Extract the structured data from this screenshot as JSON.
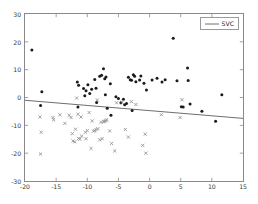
{
  "chart_data": {
    "type": "scatter",
    "title": "",
    "xlabel": "",
    "ylabel": "",
    "xlim": [
      -20,
      15
    ],
    "ylim": [
      -30,
      30
    ],
    "xticks": [
      -20,
      -15,
      -10,
      -5,
      0,
      5,
      10,
      15
    ],
    "yticks": [
      -30,
      -20,
      -10,
      0,
      10,
      20,
      30
    ],
    "xtick_labels": [
      "-20",
      "-15",
      "-10",
      "-5",
      "0",
      "5",
      "10",
      "15"
    ],
    "ytick_labels": [
      "-30",
      "-20",
      "-10",
      "0",
      "10",
      "20",
      "30"
    ],
    "grid": false,
    "legend_position": "upper right",
    "series": [
      {
        "name": "class-1",
        "marker": "o",
        "color": "#1a1a1a",
        "size": 3.0,
        "points": [
          [
            -18.9,
            17.1
          ],
          [
            -17.3,
            2.1
          ],
          [
            -17.5,
            -2.9
          ],
          [
            -11.6,
            5.6
          ],
          [
            -11.4,
            4.4
          ],
          [
            -11.5,
            -3.4
          ],
          [
            -10.6,
            3.2
          ],
          [
            -10.2,
            2.4
          ],
          [
            -10.4,
            0.6
          ],
          [
            -9.9,
            4.6
          ],
          [
            -9.6,
            1.4
          ],
          [
            -9.3,
            3.0
          ],
          [
            -8.8,
            6.5
          ],
          [
            -8.6,
            3.3
          ],
          [
            -8.5,
            -1.8
          ],
          [
            -8.0,
            7.6
          ],
          [
            -7.7,
            8.0
          ],
          [
            -7.4,
            10.3
          ],
          [
            -7.2,
            6.7
          ],
          [
            -7.0,
            7.4
          ],
          [
            -7.1,
            1.0
          ],
          [
            -6.8,
            -3.9
          ],
          [
            -6.3,
            4.9
          ],
          [
            -6.2,
            -6.4
          ],
          [
            -5.4,
            0.3
          ],
          [
            -5.0,
            -0.4
          ],
          [
            -4.6,
            -1.9
          ],
          [
            -4.2,
            -0.6
          ],
          [
            -4.0,
            -2.6
          ],
          [
            -3.7,
            -2.2
          ],
          [
            -3.4,
            7.3
          ],
          [
            -3.1,
            6.4
          ],
          [
            -2.9,
            6.2
          ],
          [
            -2.6,
            8.2
          ],
          [
            -2.4,
            7.6
          ],
          [
            -2.8,
            -4.7
          ],
          [
            -2.2,
            5.7
          ],
          [
            -1.6,
            6.3
          ],
          [
            -1.4,
            7.7
          ],
          [
            -0.9,
            5.1
          ],
          [
            -0.5,
            2.7
          ],
          [
            0.4,
            6.3
          ],
          [
            1.2,
            6.9
          ],
          [
            2.0,
            5.6
          ],
          [
            2.5,
            6.4
          ],
          [
            3.8,
            21.3
          ],
          [
            4.4,
            6.0
          ],
          [
            5.1,
            -3.3
          ],
          [
            5.4,
            -3.4
          ],
          [
            6.1,
            10.6
          ],
          [
            6.2,
            6.1
          ],
          [
            6.5,
            -2.3
          ],
          [
            8.4,
            -4.9
          ],
          [
            10.6,
            -8.5
          ],
          [
            11.6,
            1.0
          ]
        ]
      },
      {
        "name": "class-2",
        "marker": "x",
        "color": "#909090",
        "size": 3.0,
        "points": [
          [
            -17.6,
            -7.0
          ],
          [
            -17.4,
            -12.5
          ],
          [
            -17.5,
            -20.3
          ],
          [
            -15.5,
            -7.2
          ],
          [
            -15.4,
            -8.0
          ],
          [
            -14.4,
            -6.2
          ],
          [
            -13.6,
            -9.3
          ],
          [
            -12.9,
            -6.4
          ],
          [
            -12.6,
            -7.2
          ],
          [
            -12.4,
            -13.0
          ],
          [
            -12.3,
            -15.6
          ],
          [
            -12.0,
            -15.9
          ],
          [
            -11.9,
            -11.4
          ],
          [
            -11.7,
            -0.2
          ],
          [
            -11.5,
            -6.0
          ],
          [
            -11.4,
            -14.7
          ],
          [
            -11.2,
            -15.0
          ],
          [
            -11.0,
            -7.0
          ],
          [
            -10.9,
            -13.9
          ],
          [
            -10.3,
            -12.5
          ],
          [
            -10.2,
            -14.8
          ],
          [
            -10.0,
            -11.9
          ],
          [
            -9.7,
            -5.4
          ],
          [
            -9.4,
            -18.3
          ],
          [
            -9.2,
            -8.4
          ],
          [
            -9.0,
            -12.1
          ],
          [
            -8.8,
            -11.9
          ],
          [
            -8.6,
            -11.5
          ],
          [
            -8.4,
            -0.9
          ],
          [
            -8.3,
            -11.2
          ],
          [
            -8.0,
            -15.2
          ],
          [
            -7.8,
            -8.9
          ],
          [
            -7.6,
            -14.8
          ],
          [
            -7.4,
            -8.6
          ],
          [
            -7.2,
            -8.6
          ],
          [
            -7.0,
            -8.3
          ],
          [
            -6.9,
            -8.0
          ],
          [
            -6.4,
            -12.0
          ],
          [
            -6.1,
            -16.5
          ],
          [
            -5.6,
            -19.2
          ],
          [
            -5.3,
            -1.9
          ],
          [
            -4.4,
            -1.7
          ],
          [
            -3.9,
            -11.5
          ],
          [
            -3.4,
            -14.2
          ],
          [
            -2.9,
            -1.5
          ],
          [
            -2.2,
            -2.5
          ],
          [
            -1.1,
            -17.2
          ],
          [
            -0.7,
            -13.2
          ],
          [
            -0.6,
            -20.0
          ],
          [
            1.9,
            -6.2
          ],
          [
            4.9,
            -7.2
          ],
          [
            5.2,
            -0.8
          ]
        ]
      }
    ],
    "decision_line": {
      "label": "SVC",
      "color": "#6e6e6e",
      "x_start": -20,
      "y_start": -1.0,
      "x_end": 15,
      "y_end": -7.5
    }
  },
  "legend": {
    "entries": [
      {
        "label": "SVC",
        "marker": "line",
        "color": "#6e6e6e"
      }
    ]
  }
}
